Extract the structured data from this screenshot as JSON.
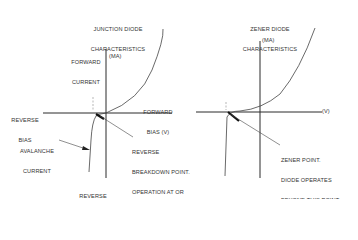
{
  "junction": {
    "title_line1": "JUNCTION DIODE",
    "title_line2": "CHARACTERISTICS",
    "forward_current_line1": "FORWARD",
    "forward_current_line2": "CURRENT",
    "ma_label": "(MA)",
    "forward_bias_line1": "FORWARD",
    "forward_bias_line2": "BIAS (V)",
    "reverse_bias_line1": "REVERSE",
    "reverse_bias_line2": "BIAS",
    "avalanche_line1": "AVALANCHE",
    "avalanche_line2": "CURRENT",
    "reverse_current_line1": "REVERSE",
    "reverse_current_line2": "CURRENT",
    "breakdown_note": [
      "REVERSE",
      "BREAKDOWN POINT.",
      "OPERATION AT OR",
      "BEYOND THIS POINT",
      "DESTROYS DIODE.",
      "(AVALANCHE",
      " CURRENT OCCURS)"
    ]
  },
  "zener": {
    "title_line1": "ZENER DIODE",
    "title_line2": "CHARACTERISTICS",
    "ma_label": "(MA)",
    "v_label": "(V)",
    "zener_note": [
      "ZENER POINT.",
      "DIODE OPERATES",
      "BEYOND THIS POINT",
      "WITHOUT BEING",
      "DESTROYED"
    ]
  },
  "colors": {
    "line": "#2a2a2a",
    "text": "#333333",
    "background": "#ffffff"
  }
}
